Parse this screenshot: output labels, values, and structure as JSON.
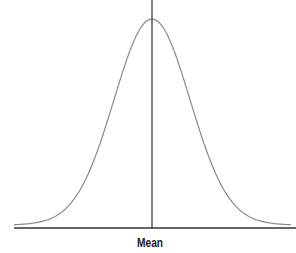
{
  "diagram": {
    "type": "normal-distribution-curve",
    "x_axis_label": "Mean",
    "mean_line": true,
    "colors": {
      "curve": "#8a8a8a",
      "axis": "#333333",
      "mean_line": "#333333"
    }
  },
  "chart_data": {
    "type": "line",
    "title": "",
    "xlabel": "Mean",
    "ylabel": "",
    "series": [
      {
        "name": "normal distribution",
        "shape": "bell curve",
        "mean": 0,
        "sd": 1
      }
    ],
    "annotations": [
      "vertical line at mean"
    ],
    "grid": false
  }
}
